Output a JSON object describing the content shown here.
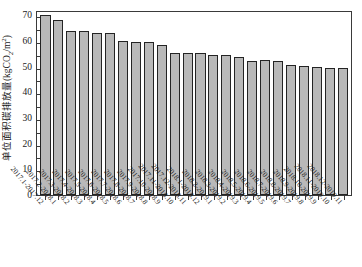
{
  "chart_data": {
    "type": "bar",
    "title": "",
    "xlabel": "",
    "ylabel": "单位面积碳排放量(kgCO₂/m²)",
    "ylabel_parts": {
      "prefix": "单位面积碳排放量(kgCO",
      "sub": "2",
      "middle": "/m",
      "sup": "2",
      "suffix": ")"
    },
    "ylim": [
      0,
      72
    ],
    "yticks": [
      0,
      10,
      20,
      30,
      40,
      50,
      60,
      70
    ],
    "ytick_labels": [
      "0",
      "10",
      "20",
      "30",
      "40",
      "50",
      "60",
      "70"
    ],
    "grid": false,
    "legend": null,
    "bar_color": "#b9b9b9",
    "bar_edge_color": "#242424",
    "categories": [
      "2017.1-2017.12",
      "2017.2-2018.1",
      "2017.3-2018.2",
      "2017.4-2018.3",
      "2017.5-2018.4",
      "2017.6-2018.5",
      "2017.7-2018.6",
      "2017.8-2018.7",
      "2017.9-2018.8",
      "2017.10-2018.9",
      "2017.11-2018.10",
      "2017.12-2018.11",
      "2018.1-2018.12",
      "2018.2-2019.1",
      "2018.3-2019.2",
      "2018.4-2019.3",
      "2018.5-2019.4",
      "2018.6-2019.5",
      "2018.7-2019.6",
      "2018.8-2019.7",
      "2018.9-2019.8",
      "2018.10-2019.9",
      "2018.11-2019.10",
      "2018.12-2019.11"
    ],
    "values": [
      70.0,
      68.0,
      64.0,
      64.0,
      63.0,
      63.0,
      60.0,
      59.4,
      59.4,
      58.4,
      55.4,
      55.4,
      55.2,
      54.6,
      54.6,
      53.8,
      52.2,
      52.4,
      52.0,
      50.6,
      50.4,
      49.8,
      49.6,
      49.4
    ]
  }
}
